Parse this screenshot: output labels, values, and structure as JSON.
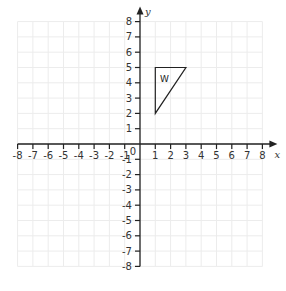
{
  "diagram": {
    "type": "coordinate-grid",
    "x_axis": {
      "label": "x",
      "min": -8,
      "max": 8,
      "ticks": [
        -8,
        -7,
        -6,
        -5,
        -4,
        -3,
        -2,
        -1,
        1,
        2,
        3,
        4,
        5,
        6,
        7,
        8
      ]
    },
    "y_axis": {
      "label": "y",
      "min": -8,
      "max": 8,
      "ticks": [
        -8,
        -7,
        -6,
        -5,
        -4,
        -3,
        -2,
        -1,
        1,
        2,
        3,
        4,
        5,
        6,
        7,
        8
      ]
    },
    "origin_label": "0",
    "shapes": [
      {
        "name": "W",
        "label": "W",
        "vertices": [
          [
            1,
            5
          ],
          [
            3,
            5
          ],
          [
            1,
            2
          ]
        ]
      }
    ],
    "colors": {
      "axis": "#222222",
      "grid": "#ececec",
      "shape": "#222222"
    }
  }
}
